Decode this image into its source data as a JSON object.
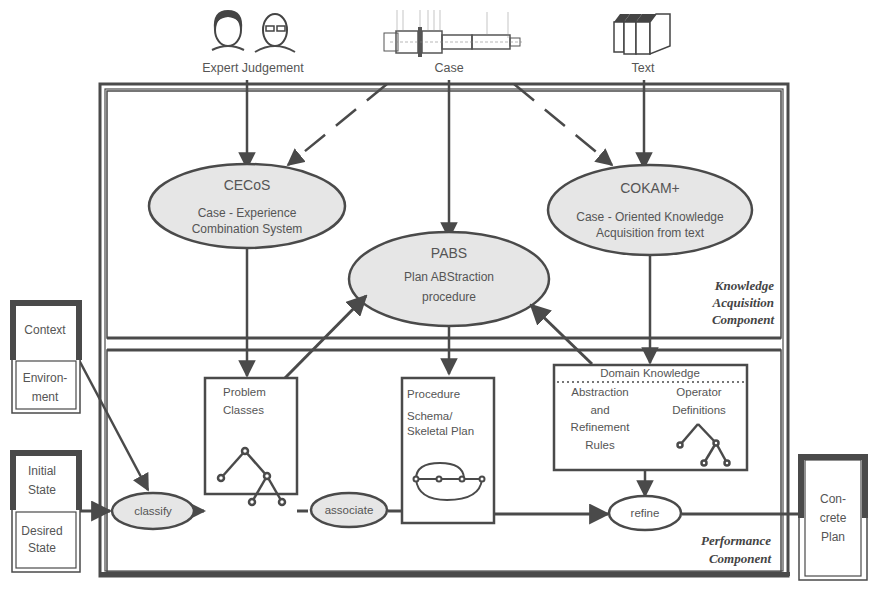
{
  "sources": {
    "expert": {
      "label": "Expert Judgement",
      "icon": "people-portraits-icon"
    },
    "case": {
      "label": "Case",
      "icon": "mechanical-shaft-drawing-icon"
    },
    "text": {
      "label": "Text",
      "icon": "books-icon"
    }
  },
  "knowledge_acquisition": {
    "title_lines": [
      "Knowledge",
      "Acquisition",
      "Component"
    ],
    "cecos": {
      "title": "CECoS",
      "lines": [
        "Case - Experience",
        "Combination System"
      ]
    },
    "pabs": {
      "title": "PABS",
      "lines": [
        "Plan ABStraction",
        "procedure"
      ]
    },
    "cokam": {
      "title": "COKAM+",
      "lines": [
        "Case - Oriented Knowledge",
        "Acquisition from text"
      ]
    }
  },
  "performance": {
    "title_lines": [
      "Performance",
      "Component"
    ],
    "problem_classes": {
      "lines": [
        "Problem",
        "Classes"
      ]
    },
    "procedure": {
      "lines": [
        "Procedure",
        "Schema/",
        "Skeletal Plan"
      ]
    },
    "domain_knowledge": {
      "title": "Domain Knowledge",
      "left_lines": [
        "Abstraction",
        "and",
        "Refinement",
        "Rules"
      ],
      "right_lines": [
        "Operator",
        "Definitions"
      ]
    },
    "processes": {
      "classify": "classify",
      "associate": "associate",
      "refine": "refine"
    }
  },
  "inputs": {
    "context_box": {
      "top": "Context",
      "bottom_lines": [
        "Environ-",
        "ment"
      ]
    },
    "state_box": {
      "top_lines": [
        "Initial",
        "State"
      ],
      "bottom_lines": [
        "Desired",
        "State"
      ]
    }
  },
  "output": {
    "concrete_plan_lines": [
      "Con-",
      "crete",
      "Plan"
    ]
  },
  "colors": {
    "line": "#4a4a4a",
    "ellipse_fill": "#e6e6e6",
    "box_fill": "#ffffff",
    "text": "#555555"
  }
}
